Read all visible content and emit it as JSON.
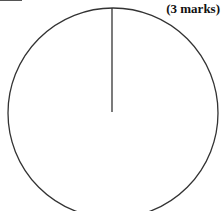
{
  "question": {
    "marks_label": "(3 marks)"
  },
  "figure": {
    "type": "circle-with-radius",
    "stroke_color": "#333333",
    "circle": {
      "cx": 113,
      "cy": 113,
      "r": 105
    },
    "radius_line": {
      "x1": 112,
      "y1": 8,
      "x2": 112,
      "y2": 112
    }
  }
}
